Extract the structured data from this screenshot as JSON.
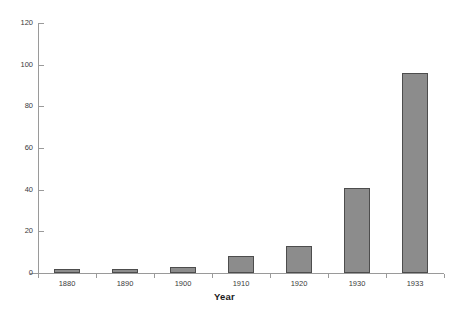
{
  "chart_data": {
    "type": "bar",
    "title": "",
    "subtitle": "",
    "xlabel": "Year",
    "ylabel": "",
    "categories": [
      "1880",
      "1890",
      "1900",
      "1910",
      "1920",
      "1930",
      "1933"
    ],
    "values": [
      2,
      2,
      3,
      8,
      13,
      41,
      96
    ],
    "series": [
      {
        "name": "",
        "values": [
          2,
          2,
          3,
          8,
          13,
          41,
          96
        ]
      }
    ],
    "ylim": [
      0,
      120
    ],
    "ytick_labels": [
      "0",
      "20",
      "40",
      "60",
      "80",
      "100",
      "120"
    ],
    "ytick_values": [
      0,
      20,
      40,
      60,
      80,
      100,
      120
    ],
    "grid": false,
    "legend": false,
    "legend_position": "none",
    "bar_fill_color": "#8c8c8c",
    "bar_border_color": "#4d4d4d",
    "axis_color": "#9a9a9a",
    "background_color": "#ffffff",
    "text_color": "#3a3a3a"
  }
}
